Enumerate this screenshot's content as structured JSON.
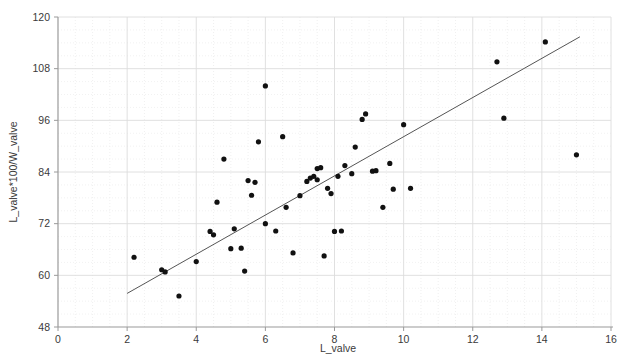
{
  "chart_data": {
    "type": "scatter",
    "title": "",
    "xlabel": "L_valve",
    "ylabel": "L_valve*100/W_valve",
    "xlim": [
      0,
      16
    ],
    "ylim": [
      48,
      120
    ],
    "xticks": [
      0,
      2,
      4,
      6,
      8,
      10,
      12,
      14,
      16
    ],
    "yticks": [
      48,
      60,
      72,
      84,
      96,
      108,
      120
    ],
    "grid": "major gridlines light grey, dotted minor gridlines",
    "legend": "none",
    "marker": {
      "shape": "circle",
      "color": "#111111",
      "size": 4
    },
    "points": [
      {
        "x": 2.2,
        "y": 64.2
      },
      {
        "x": 3.0,
        "y": 61.3
      },
      {
        "x": 3.1,
        "y": 60.8
      },
      {
        "x": 3.5,
        "y": 55.2
      },
      {
        "x": 4.0,
        "y": 63.2
      },
      {
        "x": 4.4,
        "y": 70.2
      },
      {
        "x": 4.5,
        "y": 69.4
      },
      {
        "x": 4.6,
        "y": 77.0
      },
      {
        "x": 4.8,
        "y": 87.0
      },
      {
        "x": 5.0,
        "y": 66.2
      },
      {
        "x": 5.1,
        "y": 70.8
      },
      {
        "x": 5.3,
        "y": 66.3
      },
      {
        "x": 5.4,
        "y": 61.0
      },
      {
        "x": 5.5,
        "y": 82.0
      },
      {
        "x": 5.6,
        "y": 78.6
      },
      {
        "x": 5.7,
        "y": 81.6
      },
      {
        "x": 5.8,
        "y": 91.0
      },
      {
        "x": 6.0,
        "y": 104.0
      },
      {
        "x": 6.0,
        "y": 72.0
      },
      {
        "x": 6.3,
        "y": 70.3
      },
      {
        "x": 6.5,
        "y": 92.2
      },
      {
        "x": 6.6,
        "y": 75.8
      },
      {
        "x": 6.8,
        "y": 65.2
      },
      {
        "x": 7.0,
        "y": 78.5
      },
      {
        "x": 7.2,
        "y": 81.8
      },
      {
        "x": 7.3,
        "y": 82.6
      },
      {
        "x": 7.4,
        "y": 83.0
      },
      {
        "x": 7.5,
        "y": 82.2
      },
      {
        "x": 7.5,
        "y": 84.8
      },
      {
        "x": 7.6,
        "y": 85.0
      },
      {
        "x": 7.7,
        "y": 64.5
      },
      {
        "x": 7.8,
        "y": 80.2
      },
      {
        "x": 7.9,
        "y": 79.0
      },
      {
        "x": 8.0,
        "y": 70.2
      },
      {
        "x": 8.1,
        "y": 83.0
      },
      {
        "x": 8.2,
        "y": 70.3
      },
      {
        "x": 8.3,
        "y": 85.5
      },
      {
        "x": 8.5,
        "y": 83.6
      },
      {
        "x": 8.6,
        "y": 89.8
      },
      {
        "x": 8.8,
        "y": 96.2
      },
      {
        "x": 8.9,
        "y": 97.5
      },
      {
        "x": 9.1,
        "y": 84.2
      },
      {
        "x": 9.2,
        "y": 84.3
      },
      {
        "x": 9.4,
        "y": 75.8
      },
      {
        "x": 9.6,
        "y": 86.0
      },
      {
        "x": 9.7,
        "y": 80.0
      },
      {
        "x": 10.0,
        "y": 95.0
      },
      {
        "x": 10.2,
        "y": 80.2
      },
      {
        "x": 12.7,
        "y": 109.6
      },
      {
        "x": 12.9,
        "y": 96.5
      },
      {
        "x": 14.1,
        "y": 114.2
      },
      {
        "x": 15.0,
        "y": 88.0
      }
    ],
    "trendline": {
      "type": "linear-fit",
      "x_start": 2.0,
      "y_start": 55.8,
      "x_end": 15.1,
      "y_end": 115.4,
      "color": "#555555"
    }
  },
  "axes": {
    "x_title": "L_valve",
    "y_title": "L_valve*100/W_valve",
    "x_tick_labels": [
      "0",
      "2",
      "4",
      "6",
      "8",
      "10",
      "12",
      "14",
      "16"
    ],
    "y_tick_labels": [
      "48",
      "60",
      "72",
      "84",
      "96",
      "108",
      "120"
    ]
  }
}
